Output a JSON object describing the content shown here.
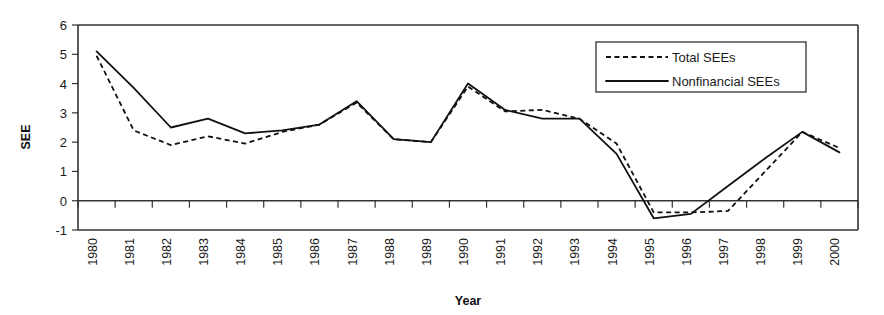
{
  "chart_data": {
    "type": "line",
    "title": "",
    "xlabel": "Year",
    "ylabel": "SEE",
    "ylim": [
      -1,
      6
    ],
    "yticks": [
      -1,
      0,
      1,
      2,
      3,
      4,
      5,
      6
    ],
    "ytick_labels": [
      "-1",
      "0",
      "1",
      "2",
      "3",
      "4",
      "5",
      "6"
    ],
    "grid": false,
    "legend_position": "top-right",
    "categories": [
      "1980",
      "1981",
      "1982",
      "1983",
      "1984",
      "1985",
      "1986",
      "1987",
      "1988",
      "1989",
      "1990",
      "1991",
      "1992",
      "1993",
      "1994",
      "1995",
      "1996",
      "1997",
      "1998",
      "1999",
      "2000"
    ],
    "x": [
      1980,
      1981,
      1982,
      1983,
      1984,
      1985,
      1986,
      1987,
      1988,
      1989,
      1990,
      1991,
      1992,
      1993,
      1994,
      1995,
      1996,
      1997,
      1998,
      1999,
      2000
    ],
    "series": [
      {
        "name": "Total SEEs",
        "style": "dashed",
        "color": "#111111",
        "values": [
          4.95,
          2.4,
          1.9,
          2.2,
          1.95,
          2.35,
          2.6,
          3.35,
          2.1,
          2.0,
          3.9,
          3.05,
          3.1,
          2.8,
          1.95,
          -0.4,
          -0.4,
          -0.35,
          1.0,
          2.35,
          1.8
        ]
      },
      {
        "name": "Nonfinancial SEEs",
        "style": "solid",
        "color": "#111111",
        "values": [
          5.1,
          3.85,
          2.5,
          2.8,
          2.3,
          2.4,
          2.6,
          3.4,
          2.1,
          2.0,
          4.0,
          3.1,
          2.8,
          2.8,
          1.6,
          -0.6,
          -0.45,
          0.5,
          1.45,
          2.35,
          1.65
        ]
      }
    ],
    "legend": [
      {
        "label": "Total SEEs",
        "style": "dashed"
      },
      {
        "label": "Nonfinancial SEEs",
        "style": "solid"
      }
    ]
  }
}
